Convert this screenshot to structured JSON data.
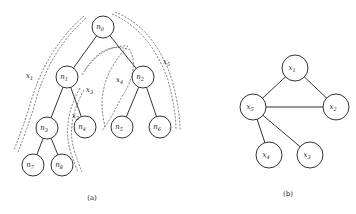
{
  "figure_a": {
    "caption": "(a)",
    "nodes": [
      {
        "id": "n0",
        "name": "n",
        "sub": "0"
      },
      {
        "id": "n1",
        "name": "n",
        "sub": "1"
      },
      {
        "id": "n2",
        "name": "n",
        "sub": "2"
      },
      {
        "id": "n3",
        "name": "n",
        "sub": "3"
      },
      {
        "id": "n4",
        "name": "n",
        "sub": "4"
      },
      {
        "id": "n5",
        "name": "n",
        "sub": "5"
      },
      {
        "id": "n6",
        "name": "n",
        "sub": "6"
      },
      {
        "id": "n7",
        "name": "n",
        "sub": "7"
      },
      {
        "id": "n8",
        "name": "n",
        "sub": "8"
      }
    ],
    "edges": [
      [
        "n0",
        "n1"
      ],
      [
        "n0",
        "n2"
      ],
      [
        "n1",
        "n3"
      ],
      [
        "n1",
        "n4"
      ],
      [
        "n2",
        "n5"
      ],
      [
        "n2",
        "n6"
      ],
      [
        "n3",
        "n7"
      ],
      [
        "n3",
        "n8"
      ]
    ],
    "paths": [
      {
        "id": "x1",
        "name": "x",
        "sub": "1"
      },
      {
        "id": "x2",
        "name": "x",
        "sub": "2"
      },
      {
        "id": "x3",
        "name": "x",
        "sub": "3"
      },
      {
        "id": "x4",
        "name": "x",
        "sub": "4"
      },
      {
        "id": "x5",
        "name": "x",
        "sub": "5"
      }
    ]
  },
  "figure_b": {
    "caption": "(b)",
    "nodes": [
      {
        "id": "x1",
        "name": "x",
        "sub": "1"
      },
      {
        "id": "x2",
        "name": "x",
        "sub": "2"
      },
      {
        "id": "x3",
        "name": "x",
        "sub": "3"
      },
      {
        "id": "x4",
        "name": "x",
        "sub": "4"
      },
      {
        "id": "x5",
        "name": "x",
        "sub": "5"
      }
    ],
    "edges": [
      [
        "x1",
        "x5"
      ],
      [
        "x1",
        "x2"
      ],
      [
        "x5",
        "x2"
      ],
      [
        "x5",
        "x4"
      ],
      [
        "x5",
        "x3"
      ]
    ]
  }
}
